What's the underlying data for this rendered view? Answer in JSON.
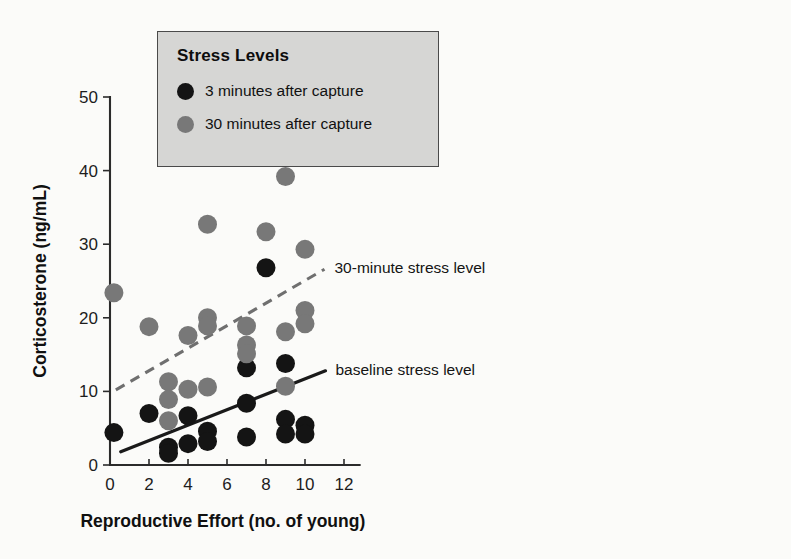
{
  "chart_data": {
    "type": "scatter",
    "title": "",
    "xlabel": "Reproductive Effort (no. of young)",
    "ylabel": "Corticosterone (ng/mL)",
    "xlim": [
      0,
      12.8
    ],
    "ylim": [
      0,
      50
    ],
    "xticks": [
      0,
      2,
      4,
      6,
      8,
      10,
      12
    ],
    "yticks": [
      0,
      10,
      20,
      30,
      40,
      50
    ],
    "grid": false,
    "legend_position": "top-left-inset",
    "series": [
      {
        "name": "3 minutes after capture",
        "color": "#141414",
        "marker": "circle",
        "points": [
          [
            0.2,
            4.4
          ],
          [
            2.0,
            7.0
          ],
          [
            3.0,
            2.4
          ],
          [
            3.0,
            1.6
          ],
          [
            4.0,
            6.7
          ],
          [
            4.0,
            2.9
          ],
          [
            5.0,
            4.6
          ],
          [
            5.0,
            3.2
          ],
          [
            7.0,
            13.2
          ],
          [
            7.0,
            8.4
          ],
          [
            7.0,
            3.8
          ],
          [
            8.0,
            26.8
          ],
          [
            9.0,
            13.8
          ],
          [
            9.0,
            6.2
          ],
          [
            9.0,
            4.2
          ],
          [
            10.0,
            5.4
          ],
          [
            10.0,
            4.2
          ]
        ]
      },
      {
        "name": "30 minutes after capture",
        "color": "#787878",
        "marker": "circle",
        "points": [
          [
            0.2,
            23.4
          ],
          [
            2.0,
            18.8
          ],
          [
            3.0,
            11.3
          ],
          [
            3.0,
            8.9
          ],
          [
            3.0,
            6.0
          ],
          [
            4.0,
            17.6
          ],
          [
            4.0,
            10.3
          ],
          [
            5.0,
            20.0
          ],
          [
            5.0,
            18.9
          ],
          [
            5.0,
            10.6
          ],
          [
            5.0,
            32.7
          ],
          [
            7.0,
            18.9
          ],
          [
            7.0,
            16.3
          ],
          [
            7.0,
            15.1
          ],
          [
            8.0,
            31.7
          ],
          [
            9.0,
            39.2
          ],
          [
            9.0,
            18.1
          ],
          [
            9.0,
            10.7
          ],
          [
            10.0,
            29.3
          ],
          [
            10.0,
            21.0
          ],
          [
            10.0,
            19.2
          ]
        ]
      }
    ],
    "fit_lines": [
      {
        "name": "30-minute stress level",
        "style": "dashed",
        "color": "#6f6f6f",
        "x0": 0.3,
        "y0": 10.2,
        "x1": 11.0,
        "y1": 26.6,
        "label": "30-minute stress level"
      },
      {
        "name": "baseline stress level",
        "style": "solid",
        "color": "#1a1a1a",
        "x0": 0.55,
        "y0": 1.8,
        "x1": 11.05,
        "y1": 12.8,
        "label": "baseline stress level"
      }
    ]
  },
  "legend": {
    "title": "Stress Levels",
    "items": [
      {
        "label": "3 minutes after capture",
        "color": "#141414",
        "marker": "black-dot-icon"
      },
      {
        "label": "30 minutes after capture",
        "color": "#787878",
        "marker": "gray-dot-icon"
      }
    ]
  },
  "axes": {
    "x_title": "Reproductive Effort (no. of young)",
    "y_title": "Corticosterone (ng/mL)",
    "x_tick_labels": [
      "0",
      "2",
      "4",
      "6",
      "8",
      "10",
      "12"
    ],
    "y_tick_labels": [
      "0",
      "10",
      "20",
      "30",
      "40",
      "50"
    ]
  },
  "annotations": {
    "dashed_label": "30-minute stress level",
    "solid_label": "baseline stress level"
  }
}
